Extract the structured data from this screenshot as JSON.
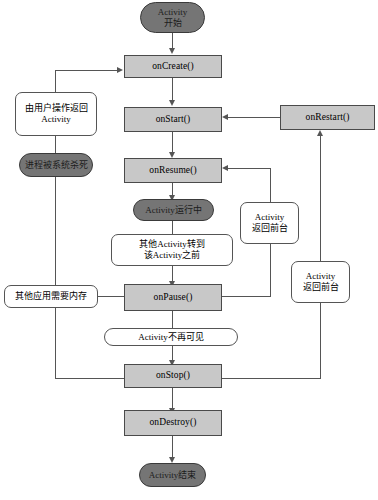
{
  "diagram": {
    "type": "flowchart",
    "colors": {
      "callback_fill": "#c8c8c8",
      "pill_fill": "#757575",
      "note_fill": "#ffffff",
      "stroke": "#555555",
      "background": "#ffffff"
    },
    "nodes": {
      "activity_start": {
        "label_line1": "Activity",
        "label_line2": "开始",
        "shape": "pill"
      },
      "on_create": {
        "label": "onCreate()",
        "shape": "rect"
      },
      "on_start": {
        "label": "onStart()",
        "shape": "rect"
      },
      "on_resume": {
        "label": "onResume()",
        "shape": "rect"
      },
      "on_restart": {
        "label": "onRestart()",
        "shape": "rect"
      },
      "on_pause": {
        "label": "onPause()",
        "shape": "rect"
      },
      "on_stop": {
        "label": "onStop()",
        "shape": "rect"
      },
      "on_destroy": {
        "label": "onDestroy()",
        "shape": "rect"
      },
      "activity_running": {
        "label": "Activity运行中",
        "shape": "pill"
      },
      "activity_end": {
        "label": "Activity结束",
        "shape": "pill"
      },
      "process_killed": {
        "label": "进程被系统杀死",
        "shape": "pill"
      },
      "note_user_return": {
        "label_line1": "由用户操作返回",
        "label_line2": "Activity",
        "shape": "note"
      },
      "note_other_activity": {
        "label_line1": "其他Activity转到",
        "label_line2": "该Activity之前",
        "shape": "note"
      },
      "note_memory_needed": {
        "label": "其他应用需要内存",
        "shape": "note"
      },
      "note_not_visible": {
        "label": "Activity不再可见",
        "shape": "note-flat"
      },
      "note_foreground_top": {
        "label_line1": "Activity",
        "label_line2": "返回前台",
        "shape": "note"
      },
      "note_foreground_bottom": {
        "label_line1": "Activity",
        "label_line2": "返回前台",
        "shape": "note"
      }
    },
    "edges": [
      {
        "from": "activity_start",
        "to": "on_create"
      },
      {
        "from": "on_create",
        "to": "on_start"
      },
      {
        "from": "on_start",
        "to": "on_resume"
      },
      {
        "from": "on_resume",
        "to": "activity_running"
      },
      {
        "from": "activity_running",
        "to": "note_other_activity"
      },
      {
        "from": "note_other_activity",
        "to": "on_pause"
      },
      {
        "from": "on_pause",
        "to": "note_not_visible"
      },
      {
        "from": "note_not_visible",
        "to": "on_stop"
      },
      {
        "from": "on_stop",
        "to": "on_destroy"
      },
      {
        "from": "on_destroy",
        "to": "activity_end"
      },
      {
        "from": "on_restart",
        "to": "on_start"
      },
      {
        "from": "on_stop",
        "to": "on_restart",
        "via": "note_foreground_bottom"
      },
      {
        "from": "on_pause",
        "to": "on_resume",
        "via": "note_foreground_top"
      },
      {
        "from": "on_pause",
        "to": "process_killed",
        "via": "note_memory_needed"
      },
      {
        "from": "on_stop",
        "to": "process_killed",
        "via": "note_memory_needed"
      },
      {
        "from": "process_killed",
        "to": "on_create",
        "via": "note_user_return"
      }
    ]
  }
}
